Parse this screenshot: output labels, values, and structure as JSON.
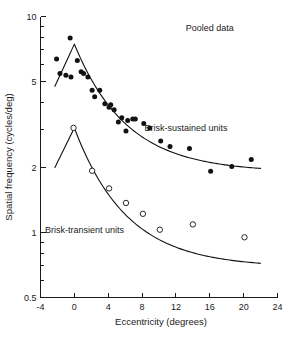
{
  "chart_data": {
    "type": "scatter",
    "title": "",
    "xlabel": "Eccentricity (degrees)",
    "ylabel": "Spatial frequency (cycles/deg)",
    "xlim": [
      -4,
      24
    ],
    "ylim": [
      0.5,
      10
    ],
    "yscale": "log",
    "xscale": "linear",
    "grid": false,
    "legend_position": "inline-annotation",
    "xticks": [
      -4,
      0,
      4,
      8,
      12,
      16,
      20,
      24
    ],
    "xtick_labels": [
      "-4",
      "0",
      "4",
      "8",
      "12",
      "16",
      "20",
      "24"
    ],
    "yticks_major": [
      0.5,
      1,
      2,
      5,
      10
    ],
    "ytick_labels": [
      "0.5",
      "1",
      "2",
      "5",
      "10"
    ],
    "yticks_minor": [
      0.6,
      0.7,
      0.8,
      0.9,
      3,
      4,
      6,
      7,
      8,
      9
    ],
    "annotations": [
      {
        "text": "Pooled data",
        "x": 16.0,
        "y": 8.6
      },
      {
        "text": "Brisk-sustained units",
        "x": 13.2,
        "y": 2.95
      },
      {
        "text": "Brisk-transient units",
        "x": 1.2,
        "y": 0.99
      }
    ],
    "series": [
      {
        "name": "Brisk-sustained units",
        "marker": "filled-circle",
        "color": "#111111",
        "points": [
          [
            -2.1,
            6.35
          ],
          [
            -1.7,
            5.45
          ],
          [
            -1.0,
            5.35
          ],
          [
            -0.5,
            7.95
          ],
          [
            -0.4,
            5.25
          ],
          [
            0.35,
            6.25
          ],
          [
            0.8,
            5.55
          ],
          [
            1.1,
            5.45
          ],
          [
            1.6,
            5.25
          ],
          [
            2.1,
            4.55
          ],
          [
            2.4,
            4.25
          ],
          [
            3.0,
            4.55
          ],
          [
            3.6,
            3.95
          ],
          [
            4.1,
            3.8
          ],
          [
            4.3,
            3.9
          ],
          [
            4.7,
            3.7
          ],
          [
            5.2,
            3.25
          ],
          [
            5.6,
            3.4
          ],
          [
            6.1,
            2.95
          ],
          [
            6.3,
            3.3
          ],
          [
            6.9,
            3.35
          ],
          [
            7.2,
            3.35
          ],
          [
            8.2,
            3.2
          ],
          [
            8.9,
            3.05
          ],
          [
            10.2,
            2.65
          ],
          [
            11.3,
            2.5
          ],
          [
            13.6,
            2.45
          ],
          [
            16.1,
            1.92
          ],
          [
            18.6,
            2.02
          ],
          [
            20.9,
            2.18
          ]
        ]
      },
      {
        "name": "Brisk-transient units",
        "marker": "open-circle",
        "color": "#111111",
        "points": [
          [
            -0.1,
            3.05
          ],
          [
            2.1,
            1.93
          ],
          [
            4.1,
            1.6
          ],
          [
            6.1,
            1.37
          ],
          [
            8.1,
            1.22
          ],
          [
            10.1,
            1.03
          ],
          [
            14.0,
            1.09
          ],
          [
            20.1,
            0.95
          ]
        ]
      }
    ],
    "fit_curves": [
      {
        "name": "Brisk-sustained fit",
        "peak_x": 0,
        "peak_y": 7.45,
        "left_end": [
          -2.3,
          4.75
        ],
        "right_end": [
          22.0,
          1.98
        ]
      },
      {
        "name": "Brisk-transient fit",
        "peak_x": 0,
        "peak_y": 3.05,
        "left_end": [
          -2.3,
          2.0
        ],
        "right_end": [
          22.0,
          0.72
        ]
      }
    ]
  },
  "figure": {
    "background": "#ffffff",
    "ink_color": "#111111"
  }
}
